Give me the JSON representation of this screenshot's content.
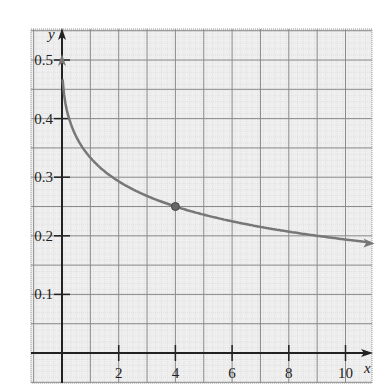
{
  "chart_data": {
    "type": "line",
    "title": "",
    "xlabel": "x",
    "ylabel": "y",
    "xlim": [
      -1.1,
      11
    ],
    "ylim": [
      -0.05,
      0.55
    ],
    "x_ticks": [
      2,
      4,
      6,
      8,
      10
    ],
    "x_tick_labels": [
      "2",
      "4",
      "6",
      "8",
      "10"
    ],
    "y_ticks": [
      0.1,
      0.2,
      0.3,
      0.4,
      0.5
    ],
    "y_tick_labels": [
      "0.1",
      "0.2",
      "0.3",
      "0.4",
      "0.5"
    ],
    "grid": true,
    "grid_step_x": 1,
    "grid_step_y": 0.05,
    "series": [
      {
        "name": "curve",
        "color": "#777777",
        "x": [
          0,
          0.25,
          0.5,
          1,
          2,
          3,
          4,
          5,
          6,
          7,
          8,
          9,
          10,
          11
        ],
        "values": [
          0.5,
          0.4,
          0.371,
          0.333,
          0.293,
          0.268,
          0.25,
          0.236,
          0.224,
          0.215,
          0.207,
          0.2,
          0.194,
          0.188
        ]
      }
    ],
    "highlighted_point": {
      "x": 4,
      "y": 0.25
    },
    "annotations": [
      "open arrow at (0, 0.5)",
      "arrow at right end"
    ]
  }
}
